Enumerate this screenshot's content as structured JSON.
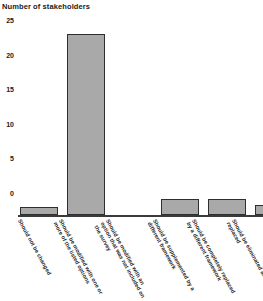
{
  "chart_data": {
    "type": "bar",
    "title": "Number of stakeholders",
    "xlabel": "",
    "ylabel": "",
    "ylim": [
      0,
      25
    ],
    "yticks": [
      0,
      5,
      10,
      15,
      20,
      25
    ],
    "grid": false,
    "legend": null,
    "categories": [
      "Should not be changed",
      "Should be modified with one or more of the listed options",
      "Should be modified with an option that was not included on the survey",
      "Should be supplemented by a different framework",
      "Should be completely replaced by a different framework",
      "Should be eliminated and not replaced"
    ],
    "values": [
      1,
      23,
      0,
      2,
      2,
      1.3
    ],
    "bar_color": "#a9a9a9",
    "bar_edge_color": "#2e2e2e",
    "text_color": "#1a1a1a"
  },
  "axis": {
    "y_tick_labels": [
      "25",
      "20",
      "15",
      "10",
      "5",
      "0"
    ]
  }
}
